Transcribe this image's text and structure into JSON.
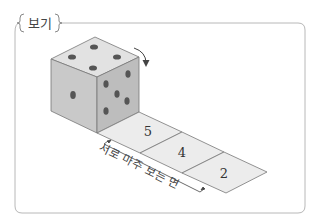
{
  "box": {
    "label": "보기"
  },
  "dice": {
    "top_face_pips": 4,
    "left_face_pips": 1,
    "right_face_pips": 5,
    "rotation_arrow": "curved-arrow-down"
  },
  "strip": {
    "cells": [
      "5",
      "4",
      "2"
    ],
    "annotation": "서로 마주 보는 면"
  },
  "colors": {
    "frame": "#b0b0b0",
    "top_face": "#e2e2e2",
    "left_face": "#c8c8c8",
    "right_face": "#bdbdbd",
    "pip": "#555555",
    "strip_fill": "#ececec",
    "line": "#555555"
  }
}
